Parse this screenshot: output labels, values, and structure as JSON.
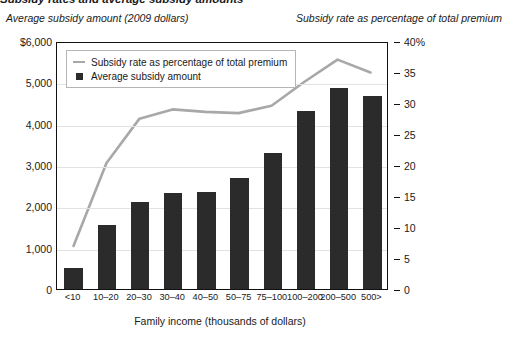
{
  "figure": {
    "cropped_top_title": "Subsidy rates and average subsidy amounts",
    "left_axis_title": "Average subsidy amount (2009 dollars)",
    "right_axis_title": "Subsidy rate as percentage of total premium",
    "xaxis_title": "Family income (thousands of dollars)"
  },
  "legend": {
    "items": [
      {
        "label": "Subsidy rate as percentage of total premium",
        "marker": "line-swatch",
        "color": "#a8a8a8"
      },
      {
        "label": "Average subsidy amount",
        "marker": "square-swatch",
        "color": "#2b2b2b"
      }
    ]
  },
  "colors": {
    "bar": "#2b2b2b",
    "line": "#a8a8a8",
    "grid": "#e2e2e2",
    "frame": "#111111",
    "text": "#1a1a1a"
  },
  "axes": {
    "left_ticks": [
      "$6,000",
      "5,000",
      "4,000",
      "3,000",
      "2,000",
      "1,000",
      "0"
    ],
    "left_tick_values": [
      6000,
      5000,
      4000,
      3000,
      2000,
      1000,
      0
    ],
    "right_ticks": [
      "40%",
      "35",
      "30",
      "25",
      "20",
      "15",
      "10",
      "5",
      "0"
    ],
    "right_tick_values": [
      40,
      35,
      30,
      25,
      20,
      15,
      10,
      5,
      0
    ]
  },
  "chart_data": {
    "type": "bar",
    "title": "Subsidy rates and average subsidy amounts",
    "xlabel": "Family income (thousands of dollars)",
    "ylabel": "Average subsidy amount (2009 dollars)",
    "y2label": "Subsidy rate as percentage of total premium",
    "ylim": [
      0,
      6000
    ],
    "y2lim": [
      0,
      40
    ],
    "grid": true,
    "legend_position": "top-left inside plot",
    "categories": [
      "<10",
      "10–20",
      "20–30",
      "30–40",
      "40–50",
      "50–75",
      "75–100",
      "100–200",
      "200–500",
      "500>"
    ],
    "series": [
      {
        "name": "Average subsidy amount",
        "type": "bar",
        "axis": "left",
        "unit": "2009 dollars",
        "values": [
          520,
          1560,
          2110,
          2320,
          2350,
          2690,
          3280,
          4310,
          4870,
          4660
        ]
      },
      {
        "name": "Subsidy rate as percentage of total premium",
        "type": "line",
        "axis": "right",
        "unit": "percent",
        "values": [
          7.0,
          20.5,
          27.7,
          29.2,
          28.8,
          28.6,
          29.8,
          33.7,
          37.3,
          35.2
        ]
      }
    ]
  }
}
